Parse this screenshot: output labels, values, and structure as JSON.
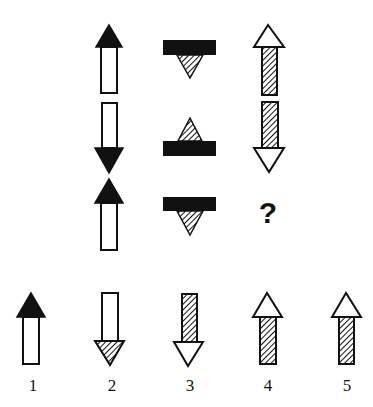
{
  "puzzle": {
    "grid": [
      [
        {
          "shape": "arrow",
          "direction": "up",
          "head_fill": "black",
          "shaft_fill": "white"
        },
        {
          "shape": "bar-triangle",
          "direction": "down",
          "bar_fill": "black",
          "triangle_fill": "hatched"
        },
        {
          "shape": "arrow",
          "direction": "up",
          "head_fill": "white",
          "shaft_fill": "hatched"
        }
      ],
      [
        {
          "shape": "arrow",
          "direction": "down",
          "head_fill": "black",
          "shaft_fill": "white"
        },
        {
          "shape": "bar-triangle",
          "direction": "up",
          "bar_fill": "black",
          "triangle_fill": "hatched"
        },
        {
          "shape": "arrow",
          "direction": "down",
          "head_fill": "white",
          "shaft_fill": "hatched"
        }
      ],
      [
        {
          "shape": "arrow",
          "direction": "up",
          "head_fill": "black",
          "shaft_fill": "white"
        },
        {
          "shape": "bar-triangle",
          "direction": "down",
          "bar_fill": "black",
          "triangle_fill": "hatched"
        },
        {
          "shape": "unknown",
          "text": "?"
        }
      ]
    ],
    "question_mark": "?",
    "options": [
      {
        "label": "1",
        "direction": "up",
        "head_fill": "black",
        "shaft_fill": "white"
      },
      {
        "label": "2",
        "direction": "down",
        "head_fill": "hatched",
        "shaft_fill": "white"
      },
      {
        "label": "3",
        "direction": "down",
        "head_fill": "white",
        "shaft_fill": "hatched"
      },
      {
        "label": "4",
        "direction": "up",
        "head_fill": "white",
        "shaft_fill": "hatched"
      },
      {
        "label": "5",
        "direction": "up",
        "head_fill": "white",
        "shaft_fill": "hatched"
      }
    ]
  },
  "colors": {
    "ink": "#111111",
    "background": "#ffffff"
  }
}
